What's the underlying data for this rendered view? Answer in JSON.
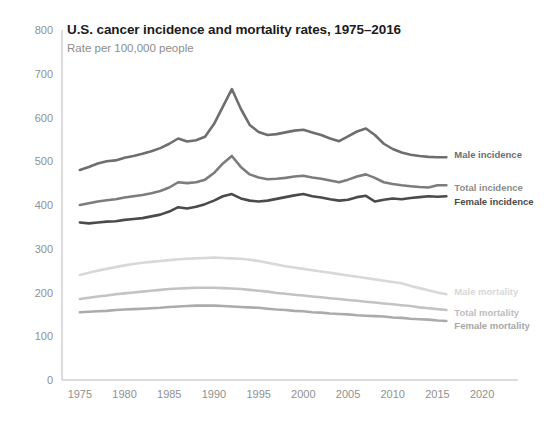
{
  "chart_data": {
    "type": "line",
    "title": "U.S. cancer incidence and mortality rates, 1975–2016",
    "subtitle": "Rate per 100,000 people",
    "xlabel": "",
    "ylabel": "",
    "xlim": [
      1973,
      2022
    ],
    "ylim": [
      0,
      800
    ],
    "grid": false,
    "legend_position": "inline-right",
    "y_ticks": [
      0,
      100,
      200,
      300,
      400,
      500,
      600,
      700,
      800
    ],
    "x_ticks": [
      1975,
      1980,
      1985,
      1990,
      1995,
      2000,
      2005,
      2010,
      2015,
      2020
    ],
    "x": [
      1975,
      1976,
      1977,
      1978,
      1979,
      1980,
      1981,
      1982,
      1983,
      1984,
      1985,
      1986,
      1987,
      1988,
      1989,
      1990,
      1991,
      1992,
      1993,
      1994,
      1995,
      1996,
      1997,
      1998,
      1999,
      2000,
      2001,
      2002,
      2003,
      2004,
      2005,
      2006,
      2007,
      2008,
      2009,
      2010,
      2011,
      2012,
      2013,
      2014,
      2015,
      2016
    ],
    "series": [
      {
        "name": "Male incidence",
        "color": "#6e6e6e",
        "values": [
          480,
          487,
          495,
          500,
          502,
          508,
          512,
          517,
          523,
          530,
          540,
          552,
          545,
          548,
          556,
          585,
          625,
          665,
          620,
          583,
          567,
          560,
          562,
          566,
          570,
          572,
          566,
          560,
          552,
          546,
          557,
          568,
          575,
          560,
          540,
          528,
          520,
          515,
          512,
          510,
          509,
          509
        ]
      },
      {
        "name": "Total incidence",
        "color": "#7c7c7c",
        "values": [
          400,
          404,
          408,
          411,
          413,
          417,
          420,
          423,
          427,
          432,
          440,
          452,
          450,
          452,
          458,
          473,
          495,
          512,
          487,
          470,
          463,
          459,
          460,
          462,
          465,
          467,
          463,
          460,
          456,
          452,
          458,
          465,
          470,
          462,
          452,
          448,
          445,
          443,
          441,
          440,
          445,
          445
        ]
      },
      {
        "name": "Female incidence",
        "color": "#4a4a4a",
        "values": [
          360,
          358,
          360,
          362,
          363,
          366,
          368,
          370,
          374,
          378,
          385,
          395,
          392,
          396,
          402,
          410,
          420,
          425,
          415,
          410,
          408,
          410,
          414,
          418,
          422,
          425,
          420,
          417,
          413,
          410,
          412,
          418,
          421,
          408,
          412,
          415,
          413,
          416,
          418,
          420,
          419,
          420
        ]
      },
      {
        "name": "Male mortality",
        "color": "#d8d8d8",
        "values": [
          240,
          245,
          250,
          254,
          258,
          262,
          265,
          268,
          270,
          272,
          274,
          276,
          277,
          278,
          279,
          280,
          279,
          278,
          277,
          275,
          272,
          268,
          264,
          260,
          257,
          254,
          251,
          248,
          245,
          242,
          239,
          236,
          233,
          230,
          227,
          224,
          221,
          215,
          210,
          205,
          200,
          196
        ]
      },
      {
        "name": "Total mortality",
        "color": "#c3c3c3",
        "values": [
          185,
          188,
          191,
          193,
          196,
          198,
          200,
          202,
          204,
          206,
          208,
          209,
          210,
          211,
          211,
          211,
          210,
          209,
          208,
          206,
          204,
          202,
          199,
          197,
          195,
          193,
          191,
          189,
          187,
          185,
          183,
          181,
          179,
          177,
          175,
          173,
          171,
          169,
          166,
          164,
          162,
          160
        ]
      },
      {
        "name": "Female mortality",
        "color": "#ababab",
        "values": [
          155,
          156,
          157,
          158,
          160,
          161,
          162,
          163,
          164,
          165,
          167,
          168,
          169,
          170,
          170,
          170,
          169,
          168,
          167,
          166,
          165,
          163,
          161,
          160,
          158,
          157,
          155,
          154,
          152,
          151,
          150,
          148,
          147,
          146,
          145,
          143,
          142,
          140,
          139,
          138,
          136,
          135
        ]
      }
    ],
    "inline_labels": [
      {
        "name": "Male incidence",
        "color": "#6e6e6e"
      },
      {
        "name": "Total incidence",
        "color": "#8c8c8c"
      },
      {
        "name": "Female incidence",
        "color": "#4a4a4a"
      },
      {
        "name": "Male mortality",
        "color": "#d8d8d8"
      },
      {
        "name": "Total mortality",
        "color": "#bdbdbd"
      },
      {
        "name": "Female mortality",
        "color": "#a8a8a8"
      }
    ]
  },
  "colors": {
    "axis": "#b9b9b9",
    "tick_text": "#909090",
    "title_text": "#1c1c1c",
    "subtitle_text": "#8d8d8d",
    "background": "#ffffff"
  }
}
